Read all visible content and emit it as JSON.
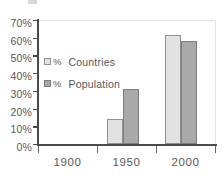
{
  "chart_data": {
    "type": "bar",
    "title": "",
    "subtitle": "",
    "xlabel": "",
    "ylabel": "",
    "categories": [
      "1900",
      "1950",
      "2000"
    ],
    "series": [
      {
        "name": "% Countries",
        "color": "#e2e2e2",
        "values": [
          0,
          14,
          61.5
        ]
      },
      {
        "name": "% Population",
        "color": "#a9a9a9",
        "values": [
          0,
          31,
          58
        ]
      }
    ],
    "ylim": [
      0,
      70
    ],
    "yticks": [
      0,
      10,
      20,
      30,
      40,
      50,
      60,
      70
    ],
    "ytick_labels": [
      "0%",
      "10%",
      "20%",
      "30%",
      "40%",
      "50%",
      "60%",
      "70%"
    ],
    "ytick_format": "percent",
    "grid": false,
    "legend_position": "upper-left-inside",
    "annotations": []
  },
  "legend": {
    "entries": [
      {
        "percent_symbol": "%",
        "label": "Countries",
        "swatch": "light-gray-swatch"
      },
      {
        "percent_symbol": "%",
        "label": "Population",
        "swatch": "dark-gray-swatch"
      }
    ]
  },
  "axes": {
    "y_tick_labels": [
      "70%",
      "60%",
      "50%",
      "40%",
      "30%",
      "20%",
      "10%",
      "0%"
    ],
    "x_tick_labels": [
      "1900",
      "1950",
      "2000"
    ]
  },
  "colors": {
    "series_countries": "#e2e2e2",
    "series_population": "#a9a9a9",
    "axis": "#4a4a4c",
    "text": "#58585a",
    "frame": "#e3e3e3",
    "background": "#ffffff"
  }
}
